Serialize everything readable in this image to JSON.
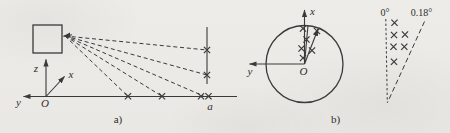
{
  "figure": {
    "background": "#ecebe7",
    "ink": "#3a3a3a",
    "panel_a": {
      "caption": "a)",
      "labels": {
        "z_axis": "z",
        "x_axis": "x",
        "y_axis": "y",
        "origin": "O",
        "distance": "a"
      },
      "fan_origin": [
        65,
        36
      ],
      "fan_targets": [
        [
          207,
          50
        ],
        [
          207,
          75
        ],
        [
          203.5,
          96
        ],
        [
          162,
          96.3
        ],
        [
          128,
          96.3
        ]
      ],
      "axis_crosses": [
        [
          128,
          96.3
        ],
        [
          162,
          96.3
        ],
        [
          201,
          96.3
        ],
        [
          208.5,
          96.3
        ]
      ],
      "target_line_crosses": [
        [
          207,
          50
        ],
        [
          207,
          75
        ]
      ]
    },
    "panel_b": {
      "caption": "b)",
      "labels": {
        "x_axis": "x",
        "y_axis": "y",
        "origin": "O"
      },
      "crosses": [
        [
          303,
          28.5
        ],
        [
          306.5,
          39.5
        ],
        [
          301.5,
          48.5
        ],
        [
          303,
          58
        ],
        [
          317,
          31
        ],
        [
          312,
          50.5
        ]
      ]
    },
    "panel_c": {
      "labels": {
        "zero_deg": "0°",
        "max_deg": "0.18°"
      },
      "crosses": [
        [
          394.5,
          22.7
        ],
        [
          394,
          35
        ],
        [
          405,
          34.5
        ],
        [
          393.5,
          46.7
        ],
        [
          404.3,
          46.7
        ],
        [
          394,
          61.7
        ]
      ]
    }
  }
}
